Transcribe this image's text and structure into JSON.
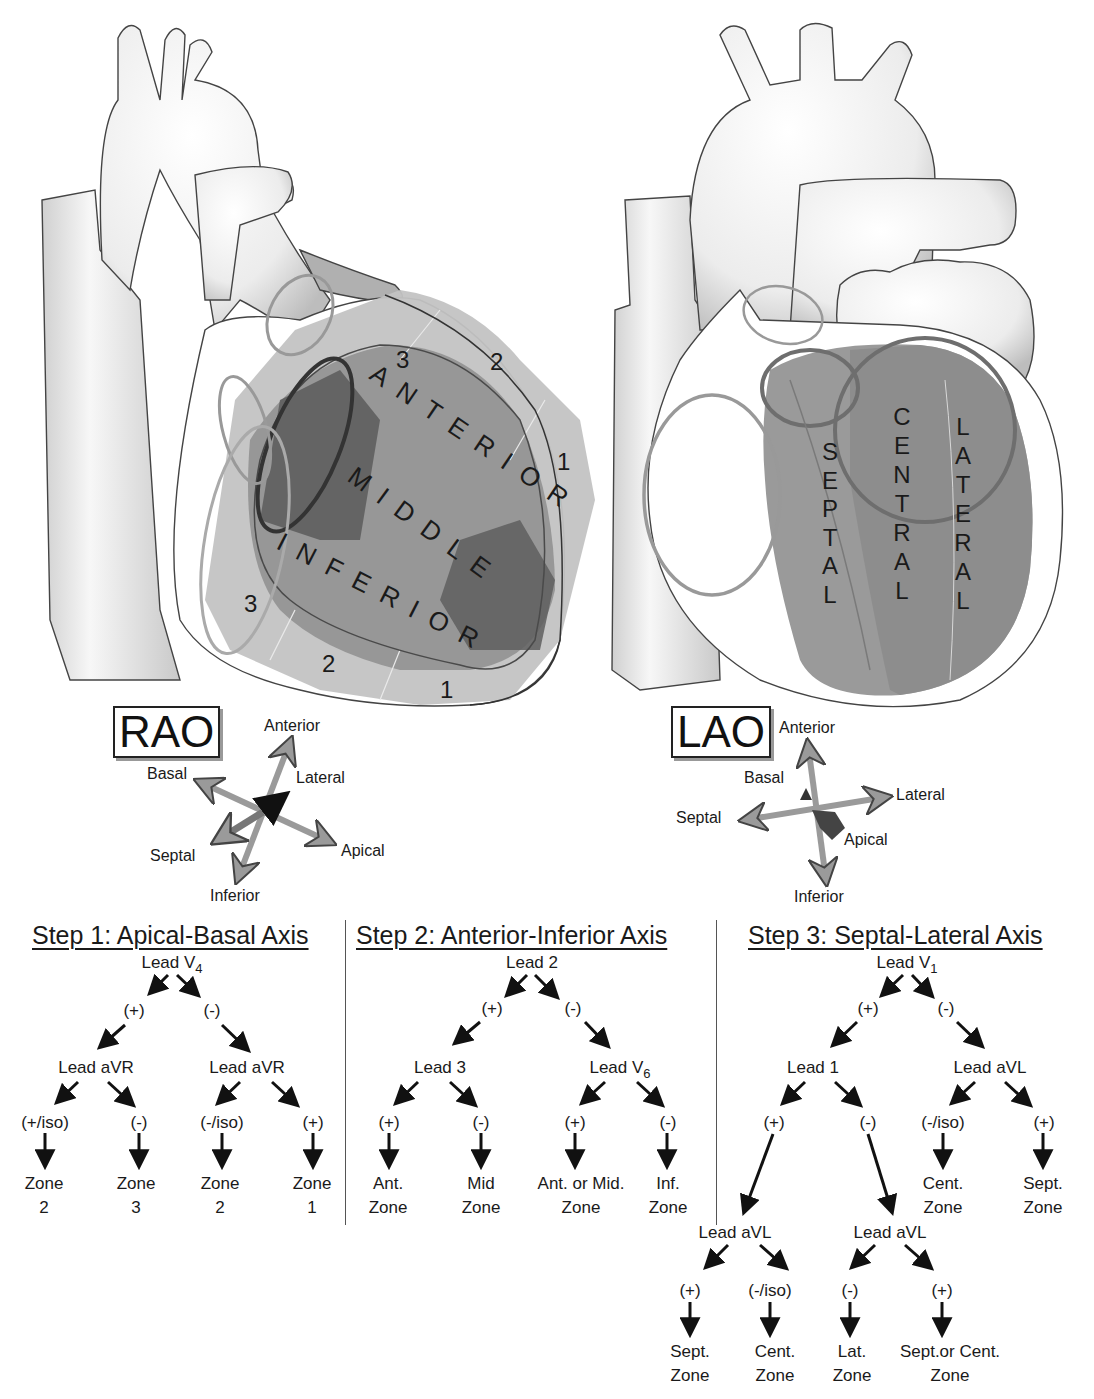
{
  "rao": {
    "view_label": "RAO",
    "bands": [
      "ANTERIOR",
      "MIDDLE",
      "INFERIOR"
    ],
    "zones_top": [
      "3",
      "2",
      "1"
    ],
    "zones_bottom": [
      "3",
      "2",
      "1"
    ],
    "compass": {
      "anterior": "Anterior",
      "lateral": "Lateral",
      "basal": "Basal",
      "septal": "Septal",
      "apical": "Apical",
      "inferior": "Inferior"
    }
  },
  "lao": {
    "view_label": "LAO",
    "columns": [
      "SEPTAL",
      "CENTRAL",
      "LATERAL"
    ],
    "compass": {
      "anterior": "Anterior",
      "basal": "Basal",
      "lateral": "Lateral",
      "septal": "Septal",
      "apical": "Apical",
      "inferior": "Inferior"
    }
  },
  "colors": {
    "outline": "#3a3a3a",
    "zone_light": "#bdbdbd",
    "zone_mid": "#8e8e8e",
    "zone_dark": "#5f5f5f",
    "arrow_fill": "#9a9a9a"
  },
  "step1": {
    "title": "Step 1: Apical-Basal Axis",
    "root": {
      "lead": "Lead V",
      "sub": "4"
    },
    "branches": [
      "(+)",
      "(-)"
    ],
    "level2": [
      "Lead aVR",
      "Lead aVR"
    ],
    "results": [
      "(+/iso)",
      "(-)",
      "(-/iso)",
      "(+)"
    ],
    "zones": [
      {
        "line1": "Zone",
        "line2": "2"
      },
      {
        "line1": "Zone",
        "line2": "3"
      },
      {
        "line1": "Zone",
        "line2": "2"
      },
      {
        "line1": "Zone",
        "line2": "1"
      }
    ]
  },
  "step2": {
    "title": "Step 2: Anterior-Inferior Axis",
    "root": {
      "lead": "Lead 2"
    },
    "branches": [
      "(+)",
      "(-)"
    ],
    "level2": [
      {
        "lead": "Lead 3",
        "sub": ""
      },
      {
        "lead": "Lead V",
        "sub": "6"
      }
    ],
    "results": [
      "(+)",
      "(-)",
      "(+)",
      "(-)"
    ],
    "zones": [
      {
        "line1": "Ant.",
        "line2": "Zone"
      },
      {
        "line1": "Mid",
        "line2": "Zone"
      },
      {
        "line1": "Ant. or Mid.",
        "line2": "Zone"
      },
      {
        "line1": "Inf.",
        "line2": "Zone"
      }
    ]
  },
  "step3": {
    "title": "Step 3: Septal-Lateral Axis",
    "root": {
      "lead": "Lead V",
      "sub": "1"
    },
    "branches": [
      "(+)",
      "(-)"
    ],
    "level2": [
      "Lead 1",
      "Lead aVL"
    ],
    "level2_results": [
      "(+)",
      "(-)",
      "(-/iso)",
      "(+)"
    ],
    "level2_zones": [
      {
        "line1": "Cent.",
        "line2": "Zone"
      },
      {
        "line1": "Sept.",
        "line2": "Zone"
      }
    ],
    "level3": [
      "Lead aVL",
      "Lead aVL"
    ],
    "level3_results": [
      "(+)",
      "(-/iso)",
      "(-)",
      "(+)"
    ],
    "level3_zones": [
      {
        "line1": "Sept.",
        "line2": "Zone"
      },
      {
        "line1": "Cent.",
        "line2": "Zone"
      },
      {
        "line1": "Lat.",
        "line2": "Zone"
      },
      {
        "line1": "Sept.or Cent.",
        "line2": "Zone"
      }
    ]
  }
}
